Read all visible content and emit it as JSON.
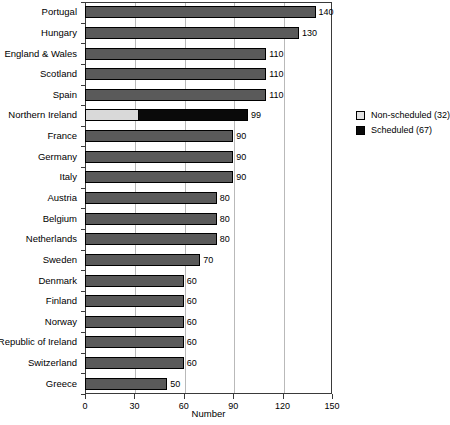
{
  "chart_data": {
    "type": "bar",
    "orientation": "horizontal",
    "title": "",
    "xlabel": "Number",
    "ylabel": "",
    "xlim": [
      0,
      150
    ],
    "xticks": [
      0,
      30,
      60,
      90,
      120,
      150
    ],
    "grid": true,
    "legend_position": "right",
    "categories": [
      "Portugal",
      "Hungary",
      "England & Wales",
      "Scotland",
      "Spain",
      "Northern Ireland",
      "France",
      "Germany",
      "Italy",
      "Austria",
      "Belgium",
      "Netherlands",
      "Sweden",
      "Denmark",
      "Finland",
      "Norway",
      "Republic of Ireland",
      "Switzerland",
      "Greece"
    ],
    "values": [
      140,
      130,
      110,
      110,
      110,
      99,
      90,
      90,
      90,
      80,
      80,
      80,
      70,
      60,
      60,
      60,
      60,
      60,
      50
    ],
    "value_labels": [
      "140",
      "130",
      "110",
      "110",
      "110",
      "99",
      "90",
      "90",
      "90",
      "80",
      "80",
      "80",
      "70",
      "60",
      "60",
      "60",
      "60",
      "60",
      "50"
    ],
    "highlight_category": "Northern Ireland",
    "highlight_segments": [
      {
        "name": "Non-scheduled",
        "value": 32,
        "color": "#d9d9d9"
      },
      {
        "name": "Scheduled",
        "value": 67,
        "color": "#0a0a0a"
      }
    ],
    "series": [
      {
        "name": "Number",
        "values": [
          140,
          130,
          110,
          110,
          110,
          99,
          90,
          90,
          90,
          80,
          80,
          80,
          70,
          60,
          60,
          60,
          60,
          60,
          50
        ],
        "color": "#5a5a5a"
      }
    ],
    "legend": [
      {
        "label": "Non-scheduled (32)",
        "color": "#d9d9d9"
      },
      {
        "label": "Scheduled (67)",
        "color": "#0a0a0a"
      }
    ]
  },
  "axis": {
    "x_title": "Number",
    "tick_labels": [
      "0",
      "30",
      "60",
      "90",
      "120",
      "150"
    ]
  },
  "legend": {
    "items": [
      {
        "label": "Non-scheduled (32)",
        "swatch": "light"
      },
      {
        "label": "Scheduled (67)",
        "swatch": "dark"
      }
    ]
  },
  "colors": {
    "bar": "#5a5a5a",
    "non_scheduled": "#d9d9d9",
    "scheduled": "#0a0a0a",
    "grid": "#b9b9b9",
    "axis": "#3a3a3a",
    "background": "#ffffff"
  }
}
